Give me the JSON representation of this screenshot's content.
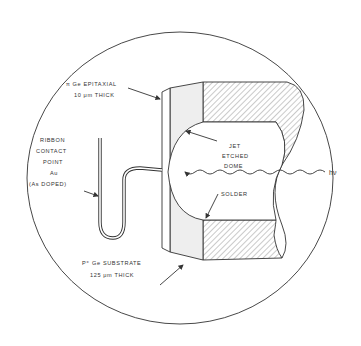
{
  "diagram": {
    "labels": {
      "epitaxial_line1": "π Ge EPITAXIAL",
      "epitaxial_line2": "10 μm THICK",
      "ribbon_line1": "RIBBON",
      "ribbon_line2": "CONTACT",
      "ribbon_line3": "POINT",
      "ribbon_line4": "Au",
      "ribbon_line5": "(As DOPED)",
      "dome_line1": "JET",
      "dome_line2": "ETCHED",
      "dome_line3": "DOME",
      "solder": "SOLDER",
      "light": "hν",
      "substrate_line1": "P⁺ Ge SUBSTRATE",
      "substrate_line2": "125 μm THICK"
    },
    "colors": {
      "line": "#333333",
      "substrate_fill": "#eeeeee",
      "hatch": "#555555",
      "background": "#ffffff"
    }
  }
}
